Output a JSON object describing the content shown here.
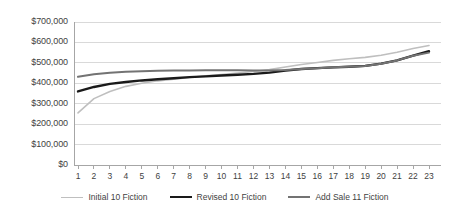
{
  "chart_data": {
    "type": "line",
    "title": "",
    "subtitle": "",
    "xlabel": "",
    "ylabel": "",
    "grid": true,
    "legend_position": "bottom",
    "ylim": [
      0,
      700000
    ],
    "yticks": [
      0,
      100000,
      200000,
      300000,
      400000,
      500000,
      600000,
      700000
    ],
    "ytick_labels": [
      "$0",
      "$100,000",
      "$200,000",
      "$300,000",
      "$400,000",
      "$500,000",
      "$600,000",
      "$700,000"
    ],
    "categories": [
      1,
      2,
      3,
      4,
      5,
      6,
      7,
      8,
      9,
      10,
      11,
      12,
      13,
      14,
      15,
      16,
      17,
      18,
      19,
      20,
      21,
      22,
      23
    ],
    "xtick_labels": [
      "1",
      "2",
      "3",
      "4",
      "5",
      "6",
      "7",
      "8",
      "9",
      "10",
      "11",
      "12",
      "13",
      "14",
      "15",
      "16",
      "17",
      "18",
      "19",
      "20",
      "21",
      "22",
      "23"
    ],
    "series": [
      {
        "name": "Initial 10 Fiction",
        "color": "#bfbfbf",
        "width": 1.6,
        "values": [
          255000,
          325000,
          360000,
          385000,
          400000,
          412000,
          420000,
          428000,
          437000,
          443000,
          450000,
          458000,
          467000,
          480000,
          492000,
          502000,
          512000,
          520000,
          527000,
          537000,
          552000,
          570000,
          585000
        ]
      },
      {
        "name": "Revised 10 Fiction",
        "color": "#1a1a1a",
        "width": 2.4,
        "values": [
          360000,
          382000,
          397000,
          406000,
          414000,
          420000,
          425000,
          430000,
          434000,
          438000,
          442000,
          446000,
          452000,
          462000,
          470000,
          474000,
          478000,
          481000,
          485000,
          496000,
          512000,
          535000,
          557000
        ]
      },
      {
        "name": "Add Sale 11 Fiction",
        "color": "#737373",
        "width": 2.0,
        "values": [
          432000,
          444000,
          452000,
          456000,
          459000,
          461000,
          462000,
          463000,
          464000,
          464000,
          464000,
          463000,
          462000,
          465000,
          470000,
          474000,
          478000,
          481000,
          485000,
          496000,
          512000,
          535000,
          550000
        ]
      }
    ]
  },
  "colors": {
    "grid": "#d9d9d9",
    "axis": "#a6a6a6",
    "text": "#3f3f3f",
    "background": "#ffffff"
  },
  "legend": {
    "items": [
      {
        "label": "Initial 10 Fiction",
        "color": "#bfbfbf",
        "width": 1.6
      },
      {
        "label": "Revised 10 Fiction",
        "color": "#1a1a1a",
        "width": 2.6
      },
      {
        "label": "Add Sale 11 Fiction",
        "color": "#737373",
        "width": 2.0
      }
    ]
  }
}
